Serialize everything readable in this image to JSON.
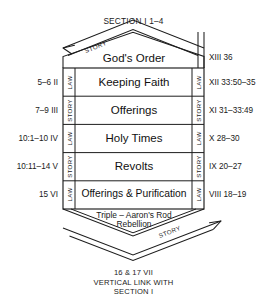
{
  "page": {
    "title": "",
    "top_section_label": "SECTION I  1–4",
    "caption_line1": "16 & 17 VII",
    "caption_line2": "VERTICAL LINK WITH",
    "caption_line3": "SECTION I",
    "ink_color": "#1a1a1a",
    "background_color": "#ffffff"
  },
  "top_chevron": {
    "center_label": "God's Order",
    "story_label": "STORY",
    "arrow_direction": "down-left",
    "right_label": "XIII 36"
  },
  "rows": [
    {
      "center_label": "Keeping Faith",
      "left_ref": "5–6 II",
      "right_ref": "XII 33:50–35",
      "left_band": "LAW",
      "right_band": "LAW"
    },
    {
      "center_label": "Offerings",
      "left_ref": "7–9 III",
      "right_ref": "XI 31–33:49",
      "left_band": "STORY",
      "right_band": "STORY"
    },
    {
      "center_label": "Holy Times",
      "left_ref": "10:1–10 IV",
      "right_ref": "X 28–30",
      "left_band": "LAW",
      "right_band": "LAW"
    },
    {
      "center_label": "Revolts",
      "left_ref": "10:11–14 V",
      "right_ref": "IX 20–27",
      "left_band": "STORY",
      "right_band": "STORY"
    },
    {
      "center_label": "Offerings & Purification",
      "left_ref": "15 VI",
      "right_ref": "VIII 18–19",
      "left_band": "LAW",
      "right_band": "LAW"
    }
  ],
  "bottom_chevron": {
    "label_line1": "Triple – Aaron's Rod",
    "label_line2": "Rebellion",
    "story_label": "STORY",
    "arrow_direction": "up-right"
  }
}
